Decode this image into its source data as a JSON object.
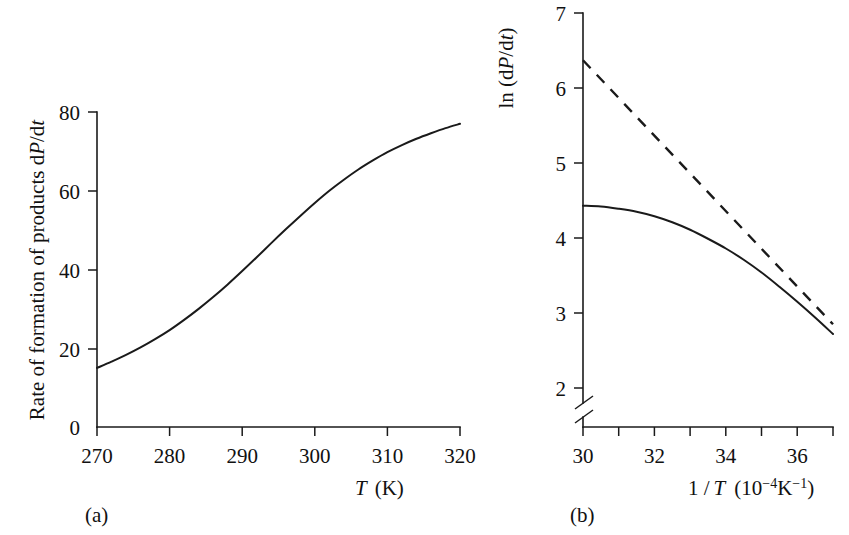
{
  "figure": {
    "background": "#ffffff",
    "ink": "#1a1a1a",
    "panel_a_tag": "(a)",
    "panel_b_tag": "(b)"
  },
  "panel_a": {
    "tag": "(a)",
    "ylabel_text": "Rate of formation of products  d",
    "ylabel_italic_1": "P",
    "ylabel_mid": "/d",
    "ylabel_italic_2": "t",
    "xlabel_italic": "T",
    "xlabel_unit": "(K)",
    "x_ticks": [
      "270",
      "280",
      "290",
      "300",
      "310",
      "320"
    ],
    "y_ticks": [
      "0",
      "20",
      "40",
      "60",
      "80"
    ]
  },
  "panel_b": {
    "tag": "(b)",
    "ylabel_pre": "ln (d",
    "ylabel_italic_1": "P",
    "ylabel_mid": "/d",
    "ylabel_italic_2": "t",
    "ylabel_post": ")",
    "xlabel_pre": "1 /",
    "xlabel_italic": "T",
    "xlabel_unit_open": "(10",
    "xlabel_exp_1": "−4",
    "xlabel_unit_k": "K",
    "xlabel_exp_2": "−1",
    "xlabel_unit_close": ")",
    "x_ticks": [
      "30",
      "32",
      "34",
      "36"
    ],
    "x_ticks_all": [
      "30",
      "31",
      "32",
      "33",
      "34",
      "35",
      "36",
      "37"
    ],
    "y_ticks": [
      "2",
      "3",
      "4",
      "5",
      "6",
      "7"
    ],
    "axis_break": true
  },
  "chart_data": [
    {
      "type": "line",
      "panel": "(a)",
      "title": "",
      "xlabel": "T (K)",
      "ylabel": "Rate of formation of products dP/dt",
      "xlim": [
        270,
        320
      ],
      "ylim": [
        0,
        84
      ],
      "xticks": [
        270,
        280,
        290,
        300,
        310,
        320
      ],
      "yticks": [
        0,
        20,
        40,
        60,
        80
      ],
      "grid": false,
      "legend": "none",
      "series": [
        {
          "name": "rate of formation",
          "style": "solid",
          "x": [
            270,
            272,
            274,
            276,
            278,
            280,
            282,
            284,
            286,
            288,
            290,
            292,
            294,
            296,
            298,
            300,
            302,
            304,
            306,
            308,
            310,
            312,
            314,
            316,
            318,
            320
          ],
          "y": [
            15.0,
            16.6,
            18.3,
            20.2,
            22.3,
            24.6,
            27.2,
            30.0,
            33.0,
            36.2,
            39.6,
            43.1,
            46.7,
            50.2,
            53.6,
            56.9,
            60.0,
            62.8,
            65.4,
            67.7,
            69.8,
            71.6,
            73.2,
            74.6,
            75.9,
            77.0
          ]
        }
      ]
    },
    {
      "type": "line",
      "panel": "(b)",
      "title": "",
      "xlabel": "1 / T (10^-4 K^-1)",
      "ylabel": "ln (dP/dt)",
      "xlim": [
        30,
        37
      ],
      "ylim": [
        1.6,
        7.0
      ],
      "xticks": [
        30,
        31,
        32,
        33,
        34,
        35,
        36,
        37
      ],
      "xticklabels": [
        "30",
        "",
        "32",
        "",
        "34",
        "",
        "36",
        ""
      ],
      "yticks": [
        2,
        3,
        4,
        5,
        6,
        7
      ],
      "grid": false,
      "legend": "none",
      "axis_break_y": [
        1.9,
        1.65
      ],
      "series": [
        {
          "name": "Arrhenius (ideal straight line)",
          "style": "dashed",
          "x": [
            30.0,
            37.0
          ],
          "y": [
            6.37,
            2.85
          ]
        },
        {
          "name": "observed (curved) Arrhenius plot",
          "style": "solid",
          "x": [
            30.0,
            30.5,
            31.0,
            31.5,
            32.0,
            32.5,
            33.0,
            33.5,
            34.0,
            34.5,
            35.0,
            35.5,
            36.0,
            36.5,
            37.0
          ],
          "y": [
            4.43,
            4.42,
            4.39,
            4.35,
            4.29,
            4.21,
            4.11,
            3.99,
            3.86,
            3.71,
            3.54,
            3.35,
            3.15,
            2.94,
            2.72
          ]
        }
      ]
    }
  ]
}
